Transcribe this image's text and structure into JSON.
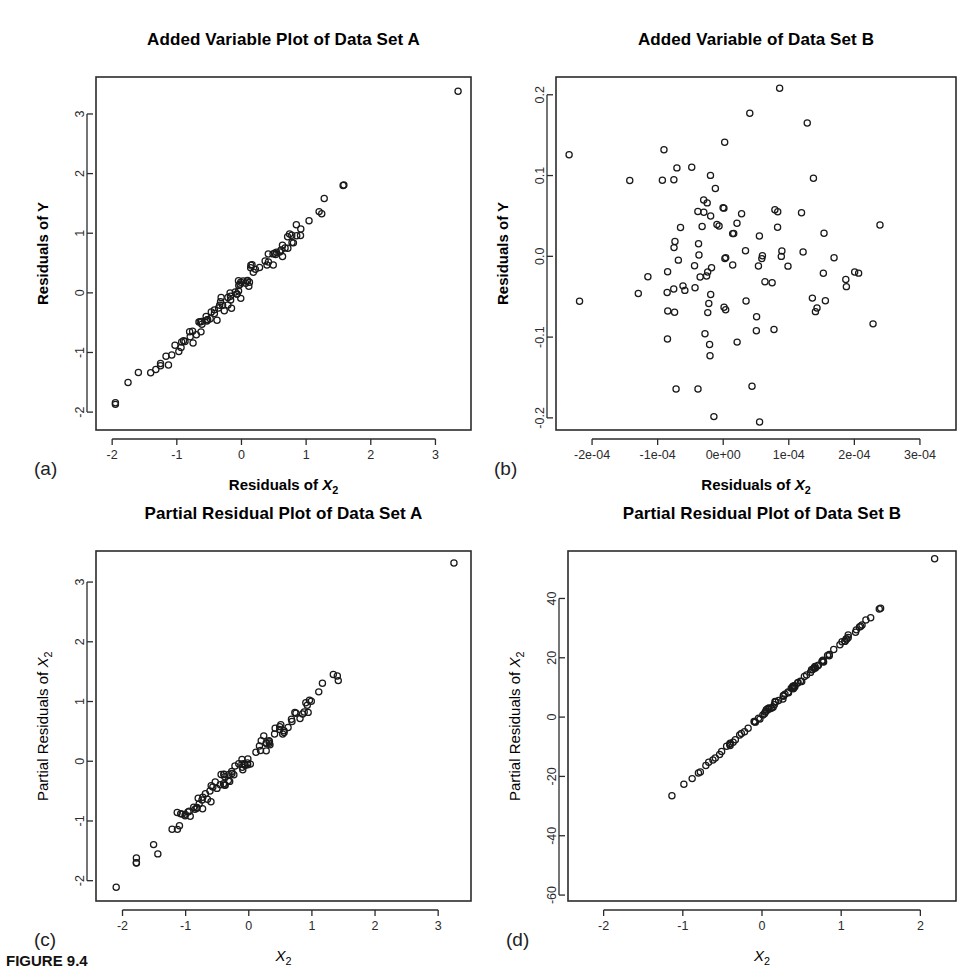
{
  "figure": {
    "caption": "FIGURE 9.4",
    "background": "#ffffff",
    "ink": "#2b2b2b",
    "point_color": "#1a1a1a"
  },
  "panels": [
    {
      "key": "a",
      "label": "(a)",
      "title": "Added Variable Plot of Data Set A",
      "xlabel_text": "Residuals of X",
      "xlabel_sub": "2",
      "xlabel_bold": true,
      "ylabel_text": "Residuals of Y",
      "ylabel_sub": "",
      "ylabel_bold": true,
      "box": {
        "left": 96,
        "top": 77,
        "width": 375,
        "height": 353
      },
      "chart_data": {
        "type": "scatter",
        "title": "Added Variable Plot of Data Set A",
        "xlabel": "Residuals of X2",
        "ylabel": "Residuals of Y",
        "xticks": [
          -2,
          -1,
          0,
          1,
          2,
          3
        ],
        "xticklabels": [
          "-2",
          "-1",
          "0",
          "1",
          "2",
          "3"
        ],
        "yticks": [
          -2,
          -1,
          0,
          1,
          2,
          3
        ],
        "yticklabels": [
          "-2",
          "-1",
          "0",
          "1",
          "2",
          "3"
        ],
        "xlim": [
          -2.25,
          3.55
        ],
        "ylim": [
          -2.3,
          3.62
        ],
        "grid": false,
        "legend": null,
        "n_points": 100,
        "description": "Tight positive linear band, slope about 1.05, with one high outlier near (3.35, 3.38)",
        "generator": {
          "mode": "linear-band",
          "seed": 17,
          "slope": 1.03,
          "intercept": 0.12,
          "x_min": -1.95,
          "x_max": 2.3,
          "x_center": -0.1,
          "x_spread": 0.78,
          "noise": 0.085,
          "extra_points": [
            [
              3.35,
              3.38
            ]
          ]
        }
      }
    },
    {
      "key": "b",
      "label": "(b)",
      "title": "Added Variable of Data Set B",
      "xlabel_text": "Residuals of X",
      "xlabel_sub": "2",
      "xlabel_bold": true,
      "ylabel_text": "Residuals of Y",
      "ylabel_sub": "",
      "ylabel_bold": true,
      "box": {
        "left": 556,
        "top": 77,
        "width": 400,
        "height": 353
      },
      "chart_data": {
        "type": "scatter",
        "title": "Added Variable of Data Set B",
        "xlabel": "Residuals of X2",
        "ylabel": "Residuals of Y",
        "xticks": [
          -0.0002,
          -0.0001,
          0,
          0.0001,
          0.0002,
          0.0003
        ],
        "xticklabels": [
          "-2e-04",
          "-1e-04",
          "0e+00",
          "1e-04",
          "2e-04",
          "3e-04"
        ],
        "yticks": [
          -0.2,
          -0.1,
          0.0,
          0.1,
          0.2
        ],
        "yticklabels": [
          "-0.2",
          "-0.1",
          "0.0",
          "0.1",
          "0.2"
        ],
        "xlim": [
          -0.000255,
          0.000355
        ],
        "ylim": [
          -0.215,
          0.222
        ],
        "grid": false,
        "legend": null,
        "n_points": 100,
        "description": "Structureless random cloud of about 100 points, no trend",
        "generator": {
          "mode": "cloud",
          "seed": 91,
          "x_center": 2e-05,
          "x_spread": 9.2e-05,
          "y_center": 0.0,
          "y_spread": 0.082,
          "x_clip": [
            -0.000235,
            0.000335
          ],
          "y_clip": [
            -0.205,
            0.208
          ]
        }
      }
    },
    {
      "key": "c",
      "label": "(c)",
      "title": "Partial Residual Plot of Data Set A",
      "xlabel_text": "X",
      "xlabel_sub": "2",
      "xlabel_bold": false,
      "ylabel_text": "Partial Residuals of X",
      "ylabel_sub": "2",
      "ylabel_bold": false,
      "box": {
        "left": 96,
        "top": 551,
        "width": 375,
        "height": 350
      },
      "chart_data": {
        "type": "scatter",
        "title": "Partial Residual Plot of Data Set A",
        "xlabel": "X2",
        "ylabel": "Partial Residuals of X2",
        "xticks": [
          -2,
          -1,
          0,
          1,
          2,
          3
        ],
        "xticklabels": [
          "-2",
          "-1",
          "0",
          "1",
          "2",
          "3"
        ],
        "yticks": [
          -2,
          -1,
          0,
          1,
          2,
          3
        ],
        "yticklabels": [
          "-2",
          "-1",
          "0",
          "1",
          "2",
          "3"
        ],
        "xlim": [
          -2.42,
          3.52
        ],
        "ylim": [
          -2.34,
          3.52
        ],
        "grid": false,
        "legend": null,
        "n_points": 100,
        "description": "Tight positive linear band, slope about 0.95, with a low point near (-2.1,-2.1) and a high point near (3.25,3.3)",
        "generator": {
          "mode": "linear-band",
          "seed": 23,
          "slope": 0.96,
          "intercept": 0.04,
          "x_min": -1.78,
          "x_max": 2.12,
          "x_center": -0.12,
          "x_spread": 0.74,
          "noise": 0.082,
          "extra_points": [
            [
              -2.1,
              -2.11
            ],
            [
              3.25,
              3.32
            ]
          ]
        }
      }
    },
    {
      "key": "d",
      "label": "(d)",
      "title": "Partial Residual Plot of Data Set B",
      "xlabel_text": "X",
      "xlabel_sub": "2",
      "xlabel_bold": false,
      "ylabel_text": "Partial Residuals of X",
      "ylabel_sub": "2",
      "ylabel_bold": false,
      "box": {
        "left": 568,
        "top": 551,
        "width": 388,
        "height": 350
      },
      "chart_data": {
        "type": "scatter",
        "title": "Partial Residual Plot of Data Set B",
        "xlabel": "X2",
        "ylabel": "Partial Residuals of X2",
        "xticks": [
          -2,
          -1,
          0,
          1,
          2
        ],
        "xticklabels": [
          "-2",
          "-1",
          "0",
          "1",
          "2"
        ],
        "yticks": [
          -60,
          -40,
          -20,
          0,
          20,
          40
        ],
        "yticklabels": [
          "-60",
          "-40",
          "-20",
          "0",
          "20",
          "40"
        ],
        "xlim": [
          -2.45,
          2.45
        ],
        "ylim": [
          -62,
          56
        ],
        "grid": false,
        "legend": null,
        "n_points": 100,
        "description": "Near-perfect straight line, slope about 24, dense overlapping points in the middle, sparse isolated points at both tails",
        "generator": {
          "mode": "tight-line",
          "seed": 5,
          "slope": 24.0,
          "intercept": 0.6,
          "x_min": -2.3,
          "x_max": 2.18,
          "x_center": 0.2,
          "x_spread": 0.62,
          "noise": 0.35
        }
      }
    }
  ]
}
